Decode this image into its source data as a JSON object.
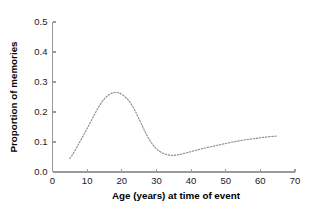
{
  "chart_data": {
    "type": "line",
    "title": "",
    "xlabel": "Age (years) at time of event",
    "ylabel": "Proportion of memories",
    "xlim": [
      0,
      70
    ],
    "ylim": [
      0.0,
      0.5
    ],
    "xticks": [
      0,
      10,
      20,
      30,
      40,
      50,
      60,
      70
    ],
    "xtick_labels": [
      "0",
      "10",
      "20",
      "30",
      "40",
      "50",
      "60",
      "70"
    ],
    "yticks": [
      0.0,
      0.1,
      0.2,
      0.3,
      0.4,
      0.5
    ],
    "ytick_labels": [
      "0.0",
      "0.1",
      "0.2",
      "0.3",
      "0.4",
      "0.5"
    ],
    "grid": false,
    "legend": false,
    "line_style": "dotted",
    "line_color": "#8d8d8d",
    "series": [
      {
        "name": "Proportion of memories",
        "x": [
          5,
          6,
          7,
          8,
          9,
          10,
          11,
          12,
          13,
          14,
          15,
          16,
          17,
          18,
          19,
          20,
          21,
          22,
          23,
          24,
          25,
          26,
          27,
          28,
          29,
          30,
          31,
          32,
          33,
          34,
          35,
          36,
          37,
          38,
          39,
          40,
          42,
          44,
          46,
          48,
          50,
          52,
          54,
          56,
          58,
          60,
          62,
          64,
          65
        ],
        "y": [
          0.045,
          0.062,
          0.082,
          0.103,
          0.124,
          0.145,
          0.167,
          0.189,
          0.21,
          0.229,
          0.244,
          0.255,
          0.262,
          0.265,
          0.264,
          0.259,
          0.25,
          0.238,
          0.221,
          0.2,
          0.176,
          0.152,
          0.128,
          0.107,
          0.09,
          0.077,
          0.068,
          0.062,
          0.058,
          0.056,
          0.0555,
          0.057,
          0.059,
          0.062,
          0.065,
          0.068,
          0.074,
          0.08,
          0.085,
          0.09,
          0.095,
          0.1,
          0.104,
          0.108,
          0.111,
          0.114,
          0.117,
          0.119,
          0.12
        ]
      }
    ]
  },
  "axes": {
    "y_axis_label": "Proportion of memories",
    "x_axis_label": "Age (years) at time of event"
  }
}
